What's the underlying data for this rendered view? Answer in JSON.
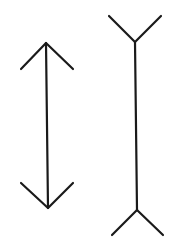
{
  "diagram": {
    "type": "muller-lyer-illusion",
    "background": "#ffffff",
    "stroke_color": "#1a1a1a",
    "stroke_width": 2.2,
    "figures": [
      {
        "name": "inward-arrows-line",
        "shaft": {
          "x1": 46,
          "y1": 43,
          "x2": 48,
          "y2": 208
        },
        "top_arms": [
          [
            21,
            69,
            46,
            43
          ],
          [
            46,
            43,
            73,
            69
          ]
        ],
        "bottom_arms": [
          [
            21,
            183,
            48,
            208
          ],
          [
            48,
            208,
            73,
            183
          ]
        ]
      },
      {
        "name": "outward-fins-line",
        "shaft": {
          "x1": 135,
          "y1": 42,
          "x2": 137,
          "y2": 210
        },
        "top_arms": [
          [
            109,
            16,
            135,
            42
          ],
          [
            135,
            42,
            161,
            16
          ]
        ],
        "bottom_arms": [
          [
            112,
            235,
            137,
            210
          ],
          [
            137,
            210,
            163,
            235
          ]
        ]
      }
    ]
  }
}
